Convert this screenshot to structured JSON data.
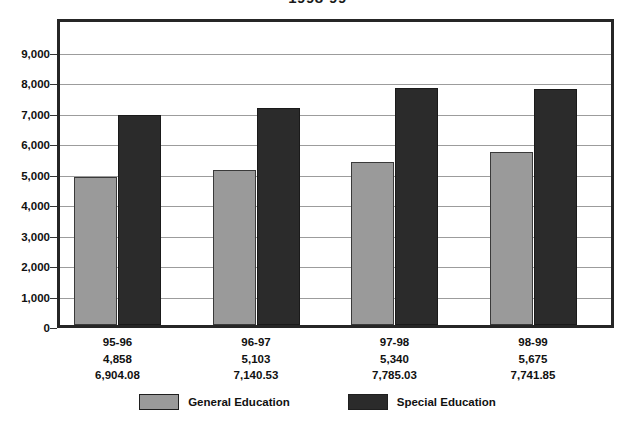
{
  "title": "1998-99",
  "colors": {
    "general": "#9a9a9a",
    "special": "#2b2b2b",
    "frame": "#262626",
    "gridline": "#9c9c9c",
    "background": "#ffffff"
  },
  "legend": {
    "general_label": "General Education",
    "special_label": "Special Education"
  },
  "yticks": [
    "9,000",
    "8,000",
    "7,000",
    "6,000",
    "5,000",
    "4,000",
    "3,000",
    "2,000",
    "1,000",
    "0"
  ],
  "groups": [
    {
      "year": "95-96",
      "general_text": "4,858",
      "special_text": "6,904.08"
    },
    {
      "year": "96-97",
      "general_text": "5,103",
      "special_text": "7,140.53"
    },
    {
      "year": "97-98",
      "general_text": "5,340",
      "special_text": "7,785.03"
    },
    {
      "year": "98-99",
      "general_text": "5,675",
      "special_text": "7,741.85"
    }
  ],
  "chart_data": {
    "type": "bar",
    "title": "1998-99",
    "xlabel": "",
    "ylabel": "",
    "ylim": [
      0,
      9500
    ],
    "yticks": [
      0,
      1000,
      2000,
      3000,
      4000,
      5000,
      6000,
      7000,
      8000,
      9000
    ],
    "grid": true,
    "legend_position": "bottom",
    "categories": [
      "95-96",
      "96-97",
      "97-98",
      "98-99"
    ],
    "series": [
      {
        "name": "General Education",
        "color": "#9a9a9a",
        "values": [
          4858,
          5103,
          5340,
          5675
        ]
      },
      {
        "name": "Special Education",
        "color": "#2b2b2b",
        "values": [
          6904.08,
          7140.53,
          7785.03,
          7741.85
        ]
      }
    ],
    "category_annotations": [
      [
        "95-96",
        "4,858",
        "6,904.08"
      ],
      [
        "96-97",
        "5,103",
        "7,140.53"
      ],
      [
        "97-98",
        "5,340",
        "7,785.03"
      ],
      [
        "98-99",
        "5,675",
        "7,741.85"
      ]
    ]
  }
}
